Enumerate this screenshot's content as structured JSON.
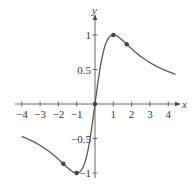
{
  "chart_data": {
    "type": "line",
    "title": "",
    "xlabel": "x",
    "ylabel": "y",
    "function": "y = 2x/(1+x^2)",
    "xlim": [
      -4.2,
      4.6
    ],
    "ylim": [
      -1.1,
      1.15
    ],
    "x_ticks": [
      -4,
      -3,
      -2,
      -1,
      1,
      2,
      3,
      4
    ],
    "x_tick_labels": [
      "−4",
      "−3",
      "−2",
      "−1",
      "1",
      "2",
      "3",
      "4"
    ],
    "y_ticks": [
      1,
      0.5,
      -0.5,
      -1
    ],
    "y_tick_labels": [
      "1",
      "0.5",
      "−0.5",
      "−1"
    ],
    "grid": false,
    "series": [
      {
        "name": "curve",
        "x": [
          -4.0,
          -3.5,
          -3.0,
          -2.5,
          -2.0,
          -1.732,
          -1.5,
          -1.0,
          -0.5,
          0.0,
          0.5,
          1.0,
          1.5,
          1.732,
          2.0,
          2.5,
          3.0,
          3.5,
          4.0,
          4.4
        ],
        "y": [
          -0.471,
          -0.528,
          -0.6,
          -0.69,
          -0.8,
          -0.866,
          -0.923,
          -1.0,
          -0.8,
          0.0,
          0.8,
          1.0,
          0.923,
          0.866,
          0.8,
          0.69,
          0.6,
          0.528,
          0.471,
          0.43
        ]
      }
    ],
    "marked_points": [
      {
        "x": -1.732,
        "y": -0.866,
        "label": "inflection"
      },
      {
        "x": -1.0,
        "y": -1.0,
        "label": "minimum"
      },
      {
        "x": 0.0,
        "y": 0.0,
        "label": "inflection"
      },
      {
        "x": 1.0,
        "y": 1.0,
        "label": "maximum"
      },
      {
        "x": 1.732,
        "y": 0.866,
        "label": "inflection"
      }
    ],
    "colors": {
      "axis": "#555555",
      "curve": "#555555",
      "point": "#444444"
    }
  }
}
